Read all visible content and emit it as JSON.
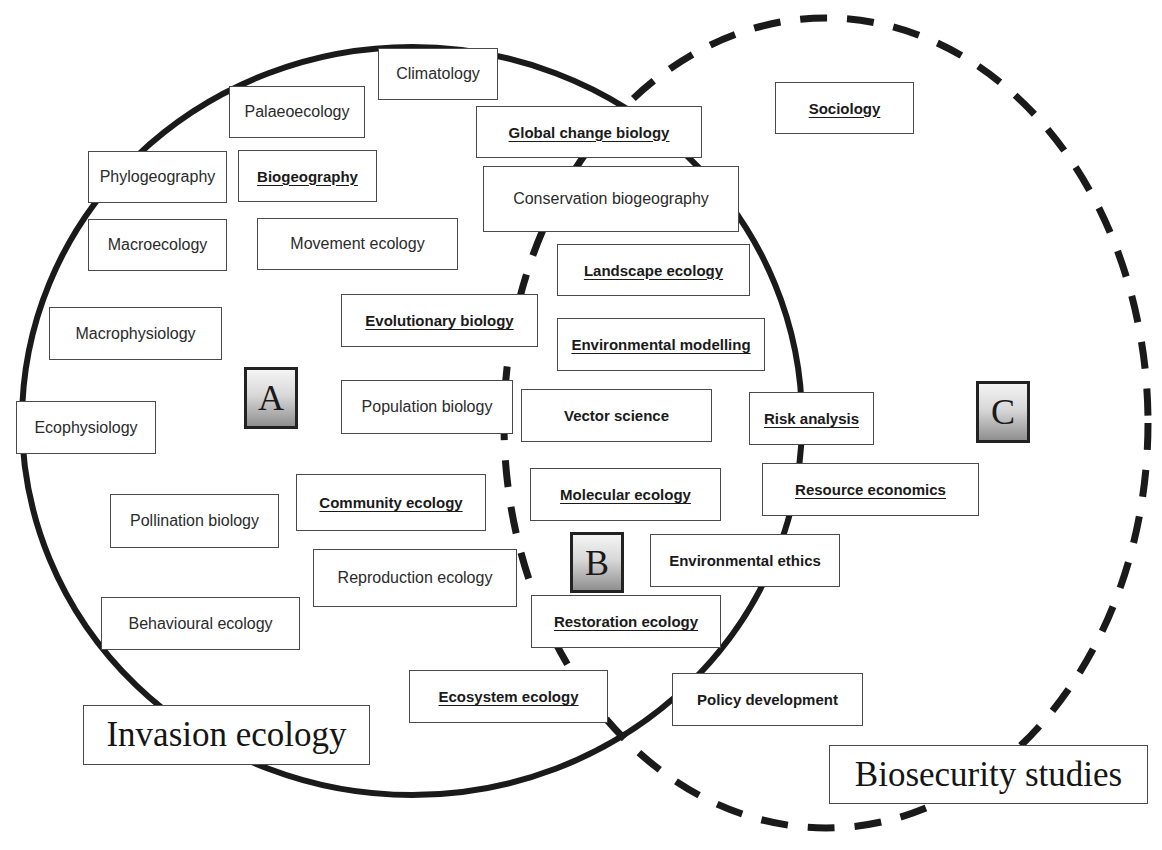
{
  "diagram": {
    "type": "venn",
    "sets": [
      {
        "id": "invasion",
        "label": "Invasion ecology",
        "stroke": "solid"
      },
      {
        "id": "biosecurity",
        "label": "Biosecurity studies",
        "stroke": "dashed"
      }
    ],
    "region_labels": {
      "A": "A",
      "B": "B",
      "C": "C"
    },
    "legend_note": "Bold underlined = discipline emphasized; bold = applied field",
    "colors": {
      "stroke": "#1a1a1a",
      "box_border": "#4a4a4a",
      "region_gradient_top": "#f4f4f4",
      "region_gradient_bottom": "#8f8f8f"
    }
  },
  "titles": {
    "invasion": "Invasion ecology",
    "biosecurity": "Biosecurity studies"
  },
  "disciplines": {
    "climatology": "Climatology",
    "palaeoecology": "Palaeoecology",
    "phylogeography": "Phylogeography",
    "biogeography": "Biogeography",
    "macroecology": "Macroecology",
    "movement_ecology": "Movement ecology",
    "global_change_biology": "Global change biology",
    "conservation_biogeography": "Conservation biogeography",
    "sociology": "Sociology",
    "landscape_ecology": "Landscape ecology",
    "macrophysiology": "Macrophysiology",
    "evolutionary_biology": "Evolutionary biology",
    "environmental_modelling": "Environmental modelling",
    "population_biology": "Population biology",
    "vector_science": "Vector science",
    "risk_analysis": "Risk analysis",
    "ecophysiology": "Ecophysiology",
    "community_ecology": "Community ecology",
    "molecular_ecology": "Molecular ecology",
    "resource_economics": "Resource economics",
    "pollination_biology": "Pollination biology",
    "environmental_ethics": "Environmental ethics",
    "reproduction_ecology": "Reproduction ecology",
    "behavioural_ecology": "Behavioural ecology",
    "restoration_ecology": "Restoration ecology",
    "ecosystem_ecology": "Ecosystem ecology",
    "policy_development": "Policy development"
  }
}
